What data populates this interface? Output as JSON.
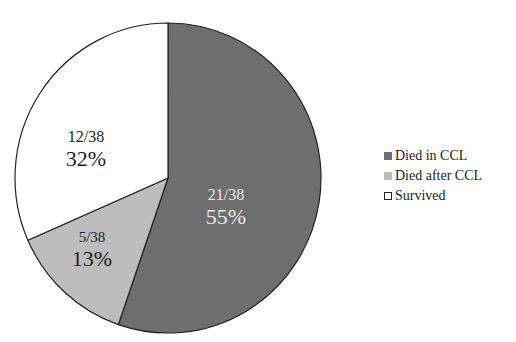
{
  "chart_data": {
    "type": "pie",
    "title": "",
    "total": 38,
    "slices": [
      {
        "label": "Died in CCL",
        "count": 21,
        "fraction": "21/38",
        "percent": "55%",
        "value": 55,
        "color": "#6e6e6e",
        "text_color": "#e8e8e8"
      },
      {
        "label": "Died after CCL",
        "count": 5,
        "fraction": "5/38",
        "percent": "13%",
        "value": 13,
        "color": "#bdbdbd",
        "text_color": "#222222"
      },
      {
        "label": "Survived",
        "count": 12,
        "fraction": "12/38",
        "percent": "32%",
        "value": 32,
        "color": "#ffffff",
        "text_color": "#222222"
      }
    ],
    "start_angle_deg": 0,
    "direction": "clockwise",
    "legend_position": "right"
  },
  "legend": {
    "items": [
      {
        "label": "Died in CCL",
        "color": "#6e6e6e"
      },
      {
        "label": "Died after CCL",
        "color": "#bdbdbd"
      },
      {
        "label": "Survived",
        "color": "#ffffff"
      }
    ]
  }
}
